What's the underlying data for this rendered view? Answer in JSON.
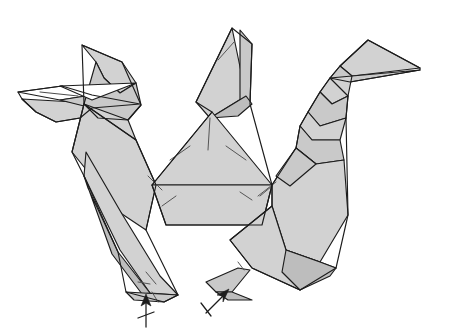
{
  "document": {
    "kind": "origami-folding-diagram",
    "title": "Origami folding step diagram",
    "background_color": "#ffffff",
    "line_color": "#1c1c1c",
    "crease_color": "#555555",
    "paper_fill_light": "#d2d2d2",
    "paper_fill_mid": "#c9c9c9",
    "paper_fill_dark": "#bdbdbd",
    "paper_fill_white": "#ffffff",
    "width": 461,
    "height": 336
  },
  "figure": {
    "caption": "",
    "parts": [
      {
        "name": "left-head",
        "label": "Left head and beak"
      },
      {
        "name": "left-neck",
        "label": "Left neck"
      },
      {
        "name": "left-body",
        "label": "Left body panel"
      },
      {
        "name": "left-leg",
        "label": "Left leg"
      },
      {
        "name": "center-spike",
        "label": "Center spike"
      },
      {
        "name": "center-triangle",
        "label": "Center triangle panel"
      },
      {
        "name": "center-base",
        "label": "Center base panel"
      },
      {
        "name": "right-head",
        "label": "Right head and long beak"
      },
      {
        "name": "right-neck",
        "label": "Right neck"
      },
      {
        "name": "right-body",
        "label": "Right body panel"
      },
      {
        "name": "right-leg",
        "label": "Right leg"
      }
    ]
  },
  "annotations": {
    "arrows": [
      {
        "name": "left-fold-arrow",
        "kind": "valley-fold-arrow-up",
        "tip_x": 146,
        "tip_y": 296,
        "tail_x": 146,
        "tail_y": 328,
        "has_tick": true
      },
      {
        "name": "right-fold-arrow",
        "kind": "valley-fold-arrow-up-left",
        "tip_x": 228,
        "tip_y": 290,
        "tail_x": 207,
        "tail_y": 312,
        "has_tick": true
      }
    ],
    "arrow_count": 2
  },
  "shapes": {
    "left_head_upper": "82,45 122,62 136,83 120,93 104,78 96,62",
    "left_head_lower": "96,62 104,78 120,93 136,83 141,105 128,120 98,118 84,104",
    "left_beak_upper": "18,92 62,86 92,95 60,100",
    "left_beak_lower": "22,99 74,102 92,101 80,118 56,122 36,112",
    "left_beak_blade": "60,100 92,95 140,104 92,108",
    "left_white_wedge": "60,86 136,83 92,100",
    "left_neck": "84,104 128,120 136,140 100,137",
    "left_body": "84,104 136,140 156,185 146,230 122,214 72,152",
    "left_body_inner": "136,140 156,185 152,222 130,200",
    "left_leg": "86,152 122,214 160,276 178,295 150,293 120,250 84,176",
    "left_leg_under": "84,176 88,188 118,252 150,293 142,294 112,254",
    "left_foot": "126,292 178,295 164,302 134,300",
    "center_spike_a": "232,28 246,96 210,118 196,102",
    "center_spike_b": "240,30 252,44 250,104 240,110",
    "center_spike_c": "246,96 252,104 238,116 210,118",
    "center_triangle": "212,112 272,185 152,185",
    "center_base": "152,185 272,185 262,225 166,225",
    "right_head_beak": "368,40 420,68 352,76 340,66",
    "right_beak_lower": "340,66 352,76 420,70 350,82 330,78",
    "right_neck_upper": "330,78 352,76 348,96 332,104 320,92",
    "right_neck_mid": "320,92 332,104 348,96 346,118 320,126 308,112",
    "right_neck_low": "308,112 320,126 346,118 340,140 312,140 300,126",
    "right_body_top": "300,126 312,140 340,140 344,160 316,164 296,148",
    "right_body": "272,185 296,148 316,164 344,160 348,215 320,262 286,250 272,206",
    "right_body_inner": "296,148 316,164 290,186 276,176",
    "right_leg": "272,206 286,250 320,262 336,268 300,290 252,268 230,240",
    "right_leg_under": "286,250 320,262 336,268 330,276 300,290 282,272",
    "right_foot": "206,282 238,268 250,270 232,292 216,292",
    "right_foot_fold": "216,292 232,292 252,300 228,300"
  },
  "creases": {
    "segments": [
      {
        "name": "center-spike-crease",
        "d": "M 218,60 L 234,42"
      },
      {
        "name": "center-triangle-mid",
        "d": "M 208,150 L 210,118"
      },
      {
        "name": "center-triangle-left",
        "d": "M 170,160 L 190,146"
      },
      {
        "name": "center-triangle-right",
        "d": "M 246,160 L 226,146"
      },
      {
        "name": "center-base-left",
        "d": "M 162,206 L 176,196"
      },
      {
        "name": "center-base-right",
        "d": "M 252,200 L 240,192"
      },
      {
        "name": "center-base-right2",
        "d": "M 260,196 L 272,186"
      },
      {
        "name": "left-body-crease",
        "d": "M 148,176 L 162,190"
      },
      {
        "name": "left-leg-crease",
        "d": "M 146,272 L 156,284"
      },
      {
        "name": "right-body-crease",
        "d": "M 258,196 L 276,182"
      },
      {
        "name": "left-foot-tick",
        "d": "M 138,282 L 150,284"
      },
      {
        "name": "left-foot-tick2",
        "d": "M 152,292 L 158,302"
      },
      {
        "name": "right-foot-tick",
        "d": "M 238,262 L 244,270"
      },
      {
        "name": "left-beak-crease",
        "d": "M 40,92 L 78,96"
      }
    ]
  }
}
